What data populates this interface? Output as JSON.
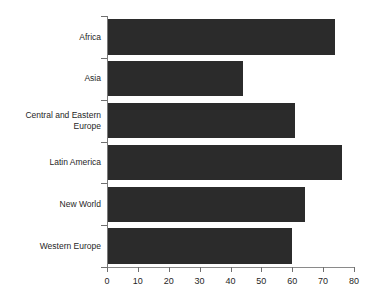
{
  "chart_data": {
    "type": "bar",
    "orientation": "horizontal",
    "title": "",
    "subtitle": "",
    "xlabel": "",
    "ylabel": "",
    "categories": [
      "Africa",
      "Asia",
      "Central and Eastern Europe",
      "Latin America",
      "New World",
      "Western Europe"
    ],
    "values": [
      74,
      44,
      61,
      76,
      64,
      60
    ],
    "xlim": [
      0,
      80
    ],
    "xticks": [
      0,
      10,
      20,
      30,
      40,
      50,
      60,
      70,
      80
    ],
    "xtick_labels": [
      "0",
      "10",
      "20",
      "30",
      "40",
      "50",
      "60",
      "70",
      "80"
    ],
    "grid": false,
    "legend": null,
    "series": [
      {
        "name": "",
        "values": [
          74,
          44,
          61,
          76,
          64,
          60
        ],
        "color": "#2b2b2b"
      }
    ],
    "annotations": []
  },
  "style": {
    "bar_color": "#2b2b2b",
    "axis_color": "#7a7a7a",
    "text_color": "#1f1f1f",
    "background": "#ffffff"
  }
}
